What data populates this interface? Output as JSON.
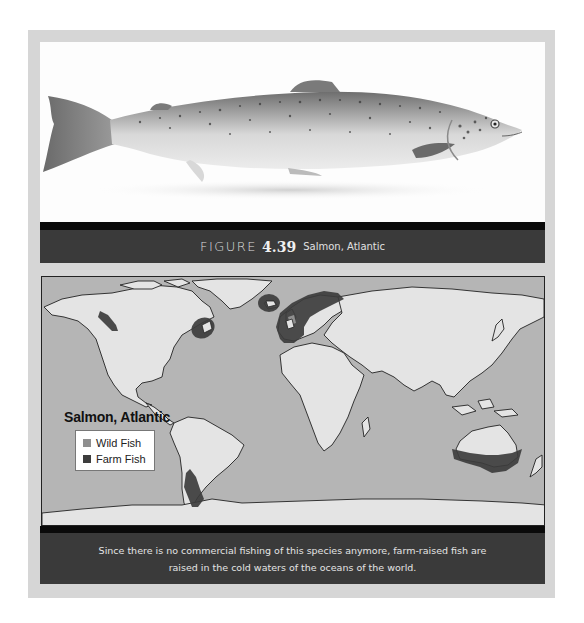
{
  "figure": {
    "label_word": "FIGURE",
    "number": "4.39",
    "title": "Salmon, Atlantic"
  },
  "photo": {
    "subject": "Atlantic salmon (whole fish, side view)"
  },
  "map": {
    "title": "Salmon, Atlantic",
    "legend": [
      {
        "label": "Wild Fish",
        "color": "#8f8f8f"
      },
      {
        "label": "Farm Fish",
        "color": "#3d3d3d"
      }
    ],
    "colors": {
      "ocean": "#b5b5b5",
      "land": "#e4e4e4",
      "farm_region": "#3d3d3d",
      "wild_region": "#8f8f8f"
    },
    "farm_regions": [
      "Pacific Northwest (British Columbia)",
      "Northeast North America (Maine / Atlantic Canada)",
      "Iceland / Faroe",
      "Norway / UK / Western Europe",
      "Southern Chile",
      "Southern Australia / Tasmania"
    ]
  },
  "caption": {
    "line1": "Since there is no commercial fishing of this species anymore, farm-raised fish are",
    "line2": "raised in the cold waters of the oceans of the world."
  }
}
